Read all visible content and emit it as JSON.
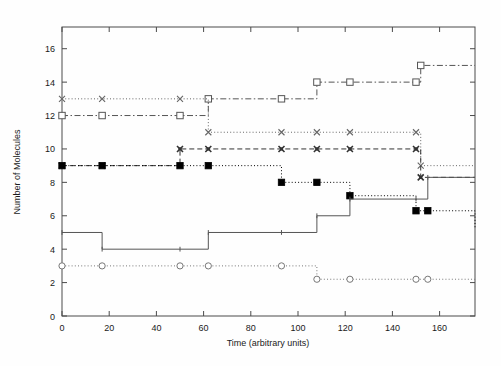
{
  "chart_data": {
    "type": "line",
    "title": "",
    "xlabel": "Time (arbitrary units)",
    "ylabel": "Number of Molecules",
    "xlim": [
      0,
      175
    ],
    "ylim": [
      0,
      17.3
    ],
    "xticks": [
      0,
      20,
      40,
      60,
      80,
      100,
      120,
      140,
      160
    ],
    "yticks": [
      0,
      2,
      4,
      6,
      8,
      10,
      12,
      14,
      16
    ],
    "grid": false,
    "legend": "none",
    "step": "post",
    "series": [
      {
        "name": "series-squares-open",
        "style": "dash-dot",
        "marker": "open-square",
        "color": "#555555",
        "x": [
          0,
          17,
          50,
          62,
          93,
          108,
          122,
          150,
          152,
          175
        ],
        "values": [
          12,
          12,
          12,
          13,
          13,
          14,
          14,
          14,
          15,
          15
        ]
      },
      {
        "name": "series-crosses-dotted",
        "style": "dotted",
        "marker": "cross",
        "color": "#666666",
        "x": [
          0,
          17,
          50,
          62,
          93,
          108,
          122,
          150,
          152,
          175
        ],
        "values": [
          13,
          13,
          13,
          11,
          11,
          11,
          11,
          11,
          9,
          9
        ]
      },
      {
        "name": "series-crosses-dashed",
        "style": "dashed",
        "marker": "cross-filled",
        "color": "#333333",
        "x": [
          0,
          17,
          50,
          62,
          93,
          108,
          122,
          150,
          152,
          175
        ],
        "values": [
          9,
          9,
          10,
          10,
          10,
          10,
          10,
          10,
          8.3,
          8.3
        ]
      },
      {
        "name": "series-squares-filled",
        "style": "dotted",
        "marker": "filled-square",
        "color": "#000000",
        "x": [
          0,
          17,
          50,
          62,
          93,
          108,
          122,
          150,
          155,
          175
        ],
        "values": [
          9,
          9,
          9,
          9,
          8,
          8,
          7.2,
          6.3,
          6.3,
          5.2
        ]
      },
      {
        "name": "series-solid-plain",
        "style": "solid",
        "marker": "tick",
        "color": "#555555",
        "x": [
          0,
          17,
          50,
          62,
          93,
          108,
          122,
          150,
          155,
          175
        ],
        "values": [
          5,
          4,
          4,
          5,
          5,
          6,
          7,
          7,
          8.3,
          8.3
        ]
      },
      {
        "name": "series-circles-open",
        "style": "dotted",
        "marker": "open-circle",
        "color": "#777777",
        "x": [
          0,
          17,
          50,
          62,
          93,
          108,
          122,
          150,
          155,
          175
        ],
        "values": [
          3,
          3,
          3,
          3,
          3,
          2.2,
          2.2,
          2.2,
          2.2,
          2.3
        ]
      }
    ]
  },
  "axes": {
    "x_title": "Time (arbitrary units)",
    "y_title": "Number of Molecules",
    "x_tick_labels": [
      "0",
      "20",
      "40",
      "60",
      "80",
      "100",
      "120",
      "140",
      "160"
    ],
    "y_tick_labels": [
      "0",
      "2",
      "4",
      "6",
      "8",
      "10",
      "12",
      "14",
      "16"
    ]
  },
  "colors": {
    "frame": "#4a4a4a",
    "background": "#ffffff",
    "text": "#1a1a1a"
  }
}
